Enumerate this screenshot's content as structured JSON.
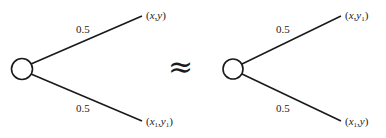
{
  "diagram": {
    "relation_symbol": "≈",
    "left_lottery": {
      "node": "chance-node",
      "branches": [
        {
          "probability": "0.5",
          "outcome": {
            "x": "x",
            "x_sub": "",
            "y": "y",
            "y_sub": ""
          }
        },
        {
          "probability": "0.5",
          "outcome": {
            "x": "x",
            "x_sub": "1",
            "y": "y",
            "y_sub": "1"
          }
        }
      ]
    },
    "right_lottery": {
      "node": "chance-node",
      "branches": [
        {
          "probability": "0.5",
          "outcome": {
            "x": "x",
            "x_sub": "",
            "y": "y",
            "y_sub": "1"
          }
        },
        {
          "probability": "0.5",
          "outcome": {
            "x": "x",
            "x_sub": "1",
            "y": "y",
            "y_sub": ""
          }
        }
      ]
    },
    "colors": {
      "stroke": "#1a1a1a",
      "background": "#ffffff"
    }
  }
}
